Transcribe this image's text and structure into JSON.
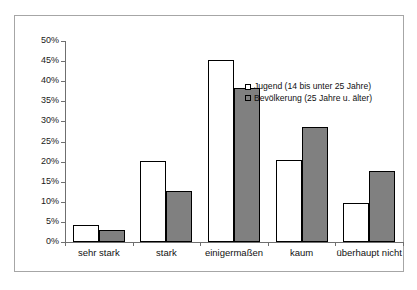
{
  "clipped_header_text": "",
  "chart_data": {
    "type": "bar",
    "title": "",
    "subtitle": "",
    "xlabel": "",
    "ylabel": "",
    "ylim": [
      0,
      50
    ],
    "ytick_step": 5,
    "ytick_labels": [
      "0%",
      "5%",
      "10%",
      "15%",
      "20%",
      "25%",
      "30%",
      "35%",
      "40%",
      "45%",
      "50%"
    ],
    "ytick_values": [
      0,
      5,
      10,
      15,
      20,
      25,
      30,
      35,
      40,
      45,
      50
    ],
    "grid": false,
    "legend_position": "upper right inside plot",
    "categories": [
      "sehr stark",
      "stark",
      "einigermaßen",
      "kaum",
      "überhaupt nicht"
    ],
    "series": [
      {
        "name": "Jugend (14 bis unter 25 Jahre)",
        "color": "#FFFFFF",
        "edge_color": "#000000",
        "values": [
          4.3,
          20.2,
          45.4,
          20.4,
          9.7
        ]
      },
      {
        "name": "Bevölkerung (25 Jahre u. älter)",
        "color": "#808080",
        "edge_color": "#000000",
        "values": [
          2.9,
          12.7,
          38.2,
          28.5,
          17.7
        ]
      }
    ]
  },
  "frame": {
    "border_color": "#A6A6A6",
    "background": "#FFFFFF"
  },
  "axis": {
    "line_color": "#6F6F6F"
  }
}
